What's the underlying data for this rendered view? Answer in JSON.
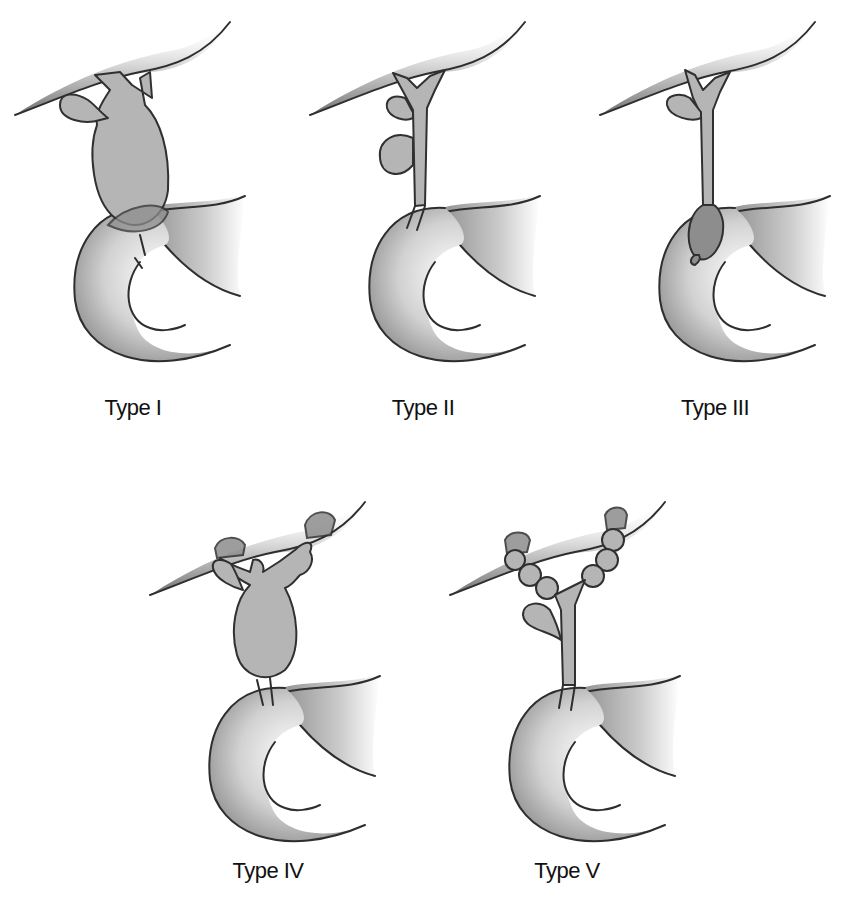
{
  "figure": {
    "panels": [
      {
        "id": "type-1",
        "label": "Type I",
        "description": "Fusiform dilatation of the extrahepatic common bile duct"
      },
      {
        "id": "type-2",
        "label": "Type II",
        "description": "Diverticulum of the extrahepatic bile duct"
      },
      {
        "id": "type-3",
        "label": "Type III",
        "description": "Choledochocele at the intraduodenal portion"
      },
      {
        "id": "type-4",
        "label": "Type IV",
        "description": "Multiple intra- and extrahepatic cysts"
      },
      {
        "id": "type-5",
        "label": "Type V",
        "description": "Multiple intrahepatic cysts (Caroli disease)"
      }
    ]
  },
  "colors": {
    "background": "#ffffff",
    "outline": "#2e2e2e",
    "duct_fill": "#b5b5b5",
    "liver_shade": "#7a7a7a",
    "duodenum_shade": "#9a9a9a",
    "label_text": "#111111"
  }
}
